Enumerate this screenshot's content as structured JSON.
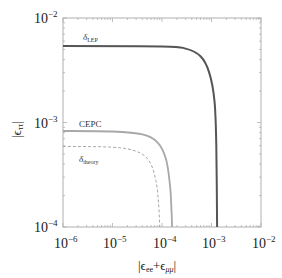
{
  "chart_data": {
    "type": "line",
    "title": "",
    "xlabel": "|ε_ee+ε_μμ|",
    "ylabel": "|ε_ττ|",
    "xscale": "log",
    "yscale": "log",
    "xlim": [
      1e-06,
      0.01
    ],
    "ylim": [
      0.0001,
      0.01
    ],
    "grid": false,
    "legend": "none (inline curve labels)",
    "x_ticks": [
      "10^-6",
      "10^-5",
      "10^-4",
      "10^-3",
      "10^-2"
    ],
    "y_ticks": [
      "10^-4",
      "10^-3",
      "10^-2"
    ],
    "series": [
      {
        "name": "δ_LEP",
        "style": "solid dark gray, thick",
        "color": "#555555",
        "description": "flat at |ε_ττ| ≈ 5.4e-3 for small x, turns down and becomes vertical at |ε_ee+ε_μμ| ≈ 1.3e-3",
        "points": [
          [
            1e-06,
            0.0054
          ],
          [
            0.0001,
            0.00535
          ],
          [
            0.0003,
            0.0051
          ],
          [
            0.0006,
            0.0043
          ],
          [
            0.0009,
            0.003
          ],
          [
            0.00115,
            0.0016
          ],
          [
            0.00125,
            0.0006
          ],
          [
            0.0013,
            0.0001
          ]
        ]
      },
      {
        "name": "CEPC",
        "style": "solid light gray",
        "color": "#a8a8a8",
        "description": "flat at |ε_ττ| ≈ 8.3e-4, vertical at |ε_ee+ε_μμ| ≈ 1.6e-4",
        "points": [
          [
            1e-06,
            0.00083
          ],
          [
            1e-05,
            0.00082
          ],
          [
            4e-05,
            0.00077
          ],
          [
            8e-05,
            0.00065
          ],
          [
            0.00012,
            0.00045
          ],
          [
            0.000145,
            0.00025
          ],
          [
            0.000155,
            0.00015
          ],
          [
            0.00016,
            0.0001
          ]
        ]
      },
      {
        "name": "δ_theory",
        "style": "dashed light gray",
        "color": "#a8a8a8",
        "description": "flat at |ε_ττ| ≈ 5.9e-4, vertical at |ε_ee+ε_μμ| ≈ 9e-5",
        "points": [
          [
            1e-06,
            0.00059
          ],
          [
            1e-05,
            0.00058
          ],
          [
            3e-05,
            0.00053
          ],
          [
            5.5e-05,
            0.00043
          ],
          [
            7.5e-05,
            0.00028
          ],
          [
            8.5e-05,
            0.00017
          ],
          [
            9e-05,
            0.0001
          ]
        ]
      }
    ]
  },
  "labels": {
    "lep": "δ",
    "lep_sub": "LEP",
    "cepc": "CEPC",
    "theory": "δ",
    "theory_sub": "theory",
    "x_axis_main": "|ϵ",
    "x_axis_sub1": "ee",
    "x_axis_plus": "+ϵ",
    "x_axis_sub2": "μμ",
    "x_axis_end": "|",
    "y_axis_main": "|ϵ",
    "y_axis_sub": "ττ",
    "y_axis_end": "|"
  },
  "ticks": {
    "base": "10",
    "x": [
      "−6",
      "−5",
      "−4",
      "−3",
      "−2"
    ],
    "y": [
      "−4",
      "−3",
      "−2"
    ]
  }
}
